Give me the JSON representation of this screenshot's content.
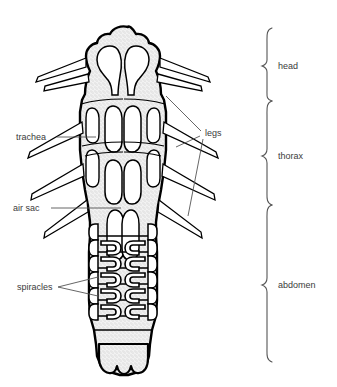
{
  "figure": {
    "background_color": "#ffffff",
    "outline_color": "#000000",
    "fill_color": "#e8e8e8",
    "label_color": "#3b3b3b",
    "leader_color": "#555555",
    "brace_color": "#555555",
    "label_font_size": "9px"
  },
  "labels": {
    "trachea": "trachea",
    "air_sac": "air sac",
    "spiracles": "spiracles",
    "legs": "legs"
  },
  "regions": [
    {
      "id": "head",
      "label": "head",
      "brace_top": 28,
      "brace_bottom": 101,
      "label_y": 66
    },
    {
      "id": "thorax",
      "label": "thorax",
      "brace_top": 101,
      "brace_bottom": 205,
      "label_y": 156
    },
    {
      "id": "abdomen",
      "label": "abdomen",
      "brace_top": 205,
      "brace_bottom": 362,
      "label_y": 285
    }
  ],
  "anatomy": {
    "body_parts": [
      "head",
      "thorax",
      "abdomen"
    ],
    "structures": [
      "trachea",
      "air sac",
      "spiracles",
      "legs"
    ],
    "abdominal_segments": 6,
    "leg_pairs": 3
  }
}
